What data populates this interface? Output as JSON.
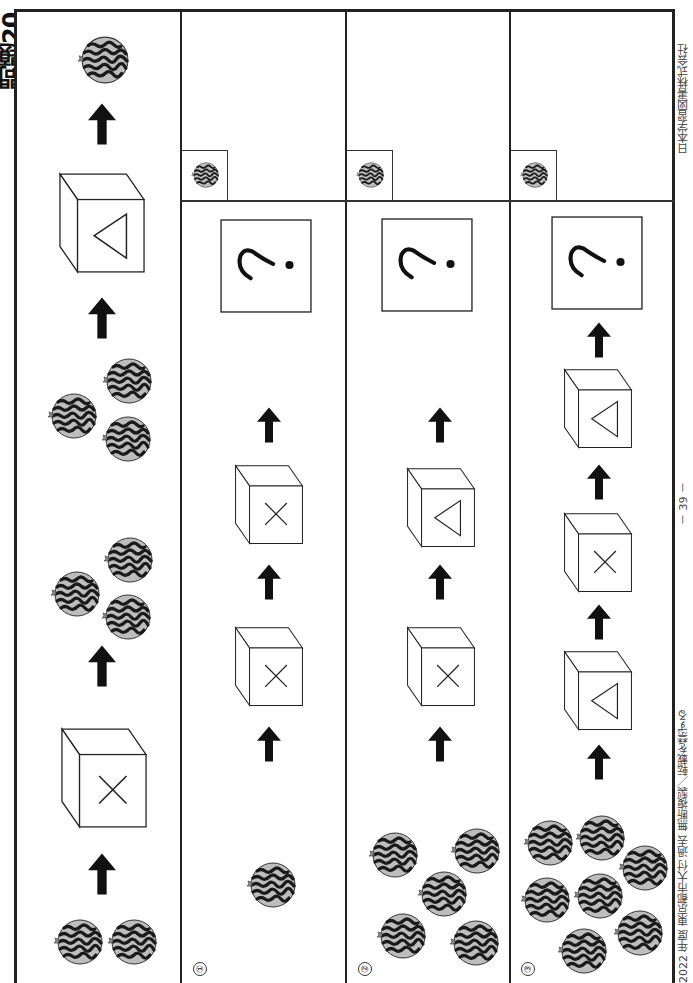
{
  "page": {
    "title": "問題20",
    "orientation": "rotated 90° clockwise",
    "page_number": "－ 39 －",
    "footer_left": "2022 年度  東京都市大付  過去  無断複製／転載を禁ずる",
    "publisher": "日本学習図書株式会社"
  },
  "legend": {
    "box_x": "×",
    "box_triangle": "△",
    "unknown": "?",
    "flow_direction": "bottom-to-top (arrows)"
  },
  "example": {
    "label": "example",
    "steps": [
      {
        "type": "watermelons",
        "count": 2
      },
      {
        "type": "arrow"
      },
      {
        "type": "box",
        "symbol": "×"
      },
      {
        "type": "arrow"
      },
      {
        "type": "watermelons",
        "count": 3
      },
      {
        "type": "watermelons",
        "count": 3
      },
      {
        "type": "arrow"
      },
      {
        "type": "box",
        "symbol": "△"
      },
      {
        "type": "arrow"
      },
      {
        "type": "watermelons",
        "count": 1
      }
    ]
  },
  "questions": [
    {
      "label": "①",
      "start_count": 1,
      "boxes": [
        "×",
        "×"
      ],
      "result": "?"
    },
    {
      "label": "②",
      "start_count": 5,
      "boxes": [
        "×",
        "△"
      ],
      "result": "?"
    },
    {
      "label": "③",
      "start_count": 7,
      "boxes": [
        "△",
        "×",
        "△"
      ],
      "result": "?"
    }
  ],
  "colors": {
    "border": "#222222",
    "watermelon_fill": "#b8b8b8",
    "watermelon_stripe": "#1a1a1a",
    "arrow": "#111111"
  }
}
